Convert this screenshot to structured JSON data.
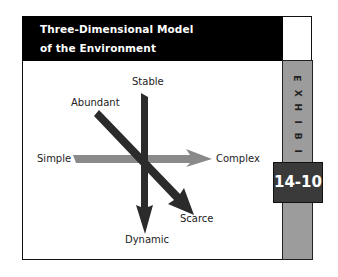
{
  "header": {
    "title_line1": "Three-Dimensional Model",
    "title_line2": "of the Environment"
  },
  "exhibit": {
    "letters": [
      "E",
      "X",
      "H",
      "I",
      "B",
      "I",
      "T"
    ],
    "number": "14-10",
    "strip_color": "#9c9c9c",
    "badge_color": "#3a3a3a"
  },
  "diagram": {
    "axes": [
      {
        "name": "stability",
        "start_label": "Stable",
        "end_label": "Dynamic",
        "color": "#2b2b2b"
      },
      {
        "name": "complexity",
        "start_label": "Simple",
        "end_label": "Complex",
        "color": "#8a8a8a"
      },
      {
        "name": "resources",
        "start_label": "Abundant",
        "end_label": "Scarce",
        "color": "#2b2b2b"
      }
    ],
    "labels": {
      "stable": "Stable",
      "abundant": "Abundant",
      "simple": "Simple",
      "complex": "Complex",
      "scarce": "Scarce",
      "dynamic": "Dynamic"
    }
  }
}
